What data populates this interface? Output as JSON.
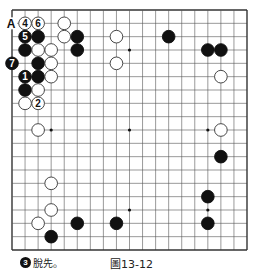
{
  "board": {
    "size": 19,
    "left": 12,
    "top": 10,
    "right": 247,
    "bottom": 250,
    "line_color": "#555555",
    "edge_color": "#333333",
    "hoshi": [
      [
        4,
        4
      ],
      [
        10,
        4
      ],
      [
        16,
        4
      ],
      [
        4,
        10
      ],
      [
        10,
        10
      ],
      [
        16,
        10
      ],
      [
        4,
        16
      ],
      [
        10,
        16
      ],
      [
        16,
        16
      ]
    ],
    "labels": [
      {
        "col": 1,
        "row": 2,
        "text": "A"
      }
    ],
    "stones": [
      {
        "col": 2,
        "row": 2,
        "color": "white",
        "num": "4"
      },
      {
        "col": 3,
        "row": 2,
        "color": "white",
        "num": "6"
      },
      {
        "col": 5,
        "row": 2,
        "color": "white",
        "num": ""
      },
      {
        "col": 2,
        "row": 3,
        "color": "black",
        "num": "5"
      },
      {
        "col": 3,
        "row": 3,
        "color": "black",
        "num": ""
      },
      {
        "col": 5,
        "row": 3,
        "color": "white",
        "num": ""
      },
      {
        "col": 6,
        "row": 3,
        "color": "black",
        "num": ""
      },
      {
        "col": 9,
        "row": 3,
        "color": "white",
        "num": ""
      },
      {
        "col": 13,
        "row": 3,
        "color": "black",
        "num": ""
      },
      {
        "col": 2,
        "row": 4,
        "color": "black",
        "num": ""
      },
      {
        "col": 3,
        "row": 4,
        "color": "white",
        "num": ""
      },
      {
        "col": 4,
        "row": 4,
        "color": "white",
        "num": ""
      },
      {
        "col": 6,
        "row": 4,
        "color": "black",
        "num": ""
      },
      {
        "col": 16,
        "row": 4,
        "color": "black",
        "num": ""
      },
      {
        "col": 17,
        "row": 4,
        "color": "black",
        "num": ""
      },
      {
        "col": 1,
        "row": 5,
        "color": "black",
        "num": "7"
      },
      {
        "col": 3,
        "row": 5,
        "color": "black",
        "num": ""
      },
      {
        "col": 4,
        "row": 5,
        "color": "white",
        "num": ""
      },
      {
        "col": 9,
        "row": 5,
        "color": "white",
        "num": ""
      },
      {
        "col": 2,
        "row": 6,
        "color": "black",
        "num": "1"
      },
      {
        "col": 3,
        "row": 6,
        "color": "black",
        "num": ""
      },
      {
        "col": 4,
        "row": 6,
        "color": "white",
        "num": ""
      },
      {
        "col": 17,
        "row": 6,
        "color": "white",
        "num": ""
      },
      {
        "col": 2,
        "row": 7,
        "color": "black",
        "num": ""
      },
      {
        "col": 3,
        "row": 7,
        "color": "white",
        "num": ""
      },
      {
        "col": 2,
        "row": 8,
        "color": "white",
        "num": ""
      },
      {
        "col": 3,
        "row": 8,
        "color": "white",
        "num": "2"
      },
      {
        "col": 3,
        "row": 10,
        "color": "white",
        "num": ""
      },
      {
        "col": 17,
        "row": 10,
        "color": "white",
        "num": ""
      },
      {
        "col": 17,
        "row": 12,
        "color": "black",
        "num": ""
      },
      {
        "col": 4,
        "row": 14,
        "color": "white",
        "num": ""
      },
      {
        "col": 16,
        "row": 15,
        "color": "black",
        "num": ""
      },
      {
        "col": 4,
        "row": 16,
        "color": "white",
        "num": ""
      },
      {
        "col": 3,
        "row": 17,
        "color": "white",
        "num": ""
      },
      {
        "col": 6,
        "row": 17,
        "color": "black",
        "num": ""
      },
      {
        "col": 9,
        "row": 17,
        "color": "black",
        "num": ""
      },
      {
        "col": 16,
        "row": 17,
        "color": "black",
        "num": ""
      },
      {
        "col": 4,
        "row": 18,
        "color": "black",
        "num": ""
      }
    ]
  },
  "caption": {
    "move_number": "3",
    "move_text": "脫先。",
    "figure_label": "圖13-12"
  }
}
